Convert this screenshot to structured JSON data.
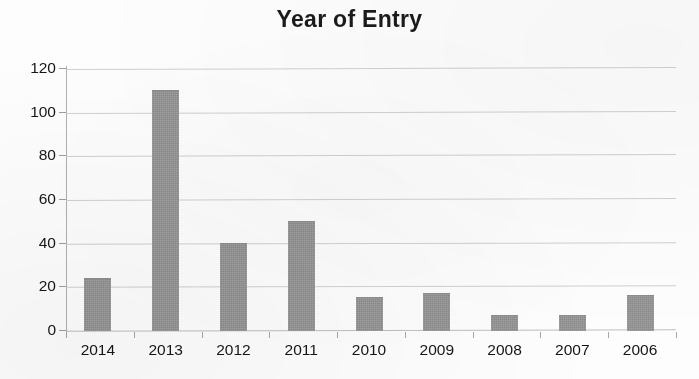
{
  "chart_data": {
    "type": "bar",
    "title": "Year of Entry",
    "xlabel": "",
    "ylabel": "",
    "categories": [
      "2014",
      "2013",
      "2012",
      "2011",
      "2010",
      "2009",
      "2008",
      "2007",
      "2006"
    ],
    "values": [
      24,
      110,
      40,
      50,
      15,
      17,
      7,
      7,
      16
    ],
    "ylim": [
      0,
      120
    ],
    "ytick_labels": [
      "0",
      "20",
      "40",
      "60",
      "80",
      "100",
      "120"
    ],
    "ytick_values": [
      0,
      20,
      40,
      60,
      80,
      100,
      120
    ],
    "grid": true,
    "legend": false,
    "bar_color": "#969696",
    "axis_color": "#b0b0b0",
    "gridline_color": "#c9c9c9",
    "text_color": "#161616",
    "background_color": "#fdfdfd"
  }
}
